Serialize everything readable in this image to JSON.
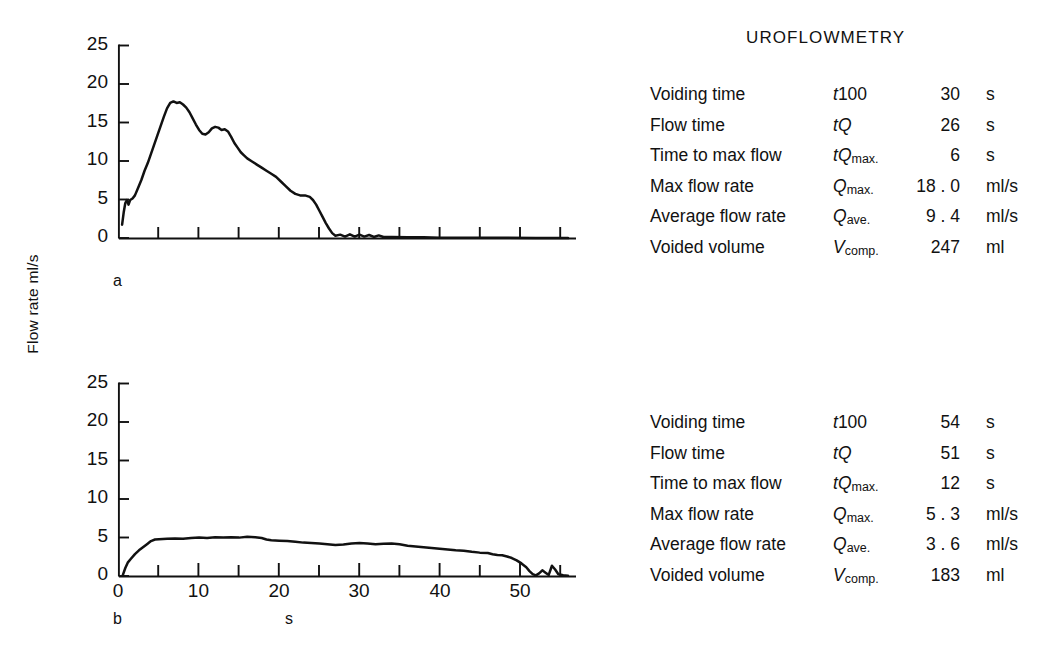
{
  "report": {
    "title": "UROFLOWMETRY",
    "columns": [
      "parameter",
      "symbol",
      "value",
      "unit"
    ],
    "panel_a": {
      "panel_letter": "a",
      "rows": [
        {
          "parameter": "Voiding time",
          "symbol_base": "t",
          "symbol_rest": "100",
          "symbol_sub": "",
          "value": "30",
          "unit": "s"
        },
        {
          "parameter": "Flow time",
          "symbol_base": "t",
          "symbol_rest": "Q",
          "symbol_sub": "",
          "value": "26",
          "unit": "s"
        },
        {
          "parameter": "Time to max flow",
          "symbol_base": "t",
          "symbol_rest": "Q",
          "symbol_sub": "max.",
          "value": "6",
          "unit": "s"
        },
        {
          "parameter": "Max flow rate",
          "symbol_base": "",
          "symbol_rest": "Q",
          "symbol_sub": "max.",
          "value": "18 . 0",
          "unit": "ml/s"
        },
        {
          "parameter": "Average flow rate",
          "symbol_base": "",
          "symbol_rest": "Q",
          "symbol_sub": "ave.",
          "value": "9 . 4",
          "unit": "ml/s"
        },
        {
          "parameter": "Voided volume",
          "symbol_base": "",
          "symbol_rest": "V",
          "symbol_sub": "comp.",
          "value": "247",
          "unit": "ml"
        }
      ]
    },
    "panel_b": {
      "panel_letter": "b",
      "rows": [
        {
          "parameter": "Voiding time",
          "symbol_base": "t",
          "symbol_rest": "100",
          "symbol_sub": "",
          "value": "54",
          "unit": "s"
        },
        {
          "parameter": "Flow time",
          "symbol_base": "t",
          "symbol_rest": "Q",
          "symbol_sub": "",
          "value": "51",
          "unit": "s"
        },
        {
          "parameter": "Time to max flow",
          "symbol_base": "t",
          "symbol_rest": "Q",
          "symbol_sub": "max.",
          "value": "12",
          "unit": "s"
        },
        {
          "parameter": "Max flow rate",
          "symbol_base": "",
          "symbol_rest": "Q",
          "symbol_sub": "max.",
          "value": "5 . 3",
          "unit": "ml/s"
        },
        {
          "parameter": "Average flow rate",
          "symbol_base": "",
          "symbol_rest": "Q",
          "symbol_sub": "ave.",
          "value": "3 . 6",
          "unit": "ml/s"
        },
        {
          "parameter": "Voided volume",
          "symbol_base": "",
          "symbol_rest": "V",
          "symbol_sub": "comp.",
          "value": "183",
          "unit": "ml"
        }
      ]
    }
  },
  "axes": {
    "ylabel": "Flow rate ml/s",
    "xcaption": "s",
    "ytick_labels": [
      "25",
      "20",
      "15",
      "10",
      "5",
      "0"
    ],
    "ytick_values": [
      25,
      20,
      15,
      10,
      5,
      0
    ],
    "xtick_labels_b": [
      "0",
      "10",
      "20",
      "30",
      "40",
      "50"
    ],
    "xtick_values_b": [
      0,
      10,
      20,
      30,
      40,
      50
    ],
    "xminor_step": 5
  },
  "chart_data": [
    {
      "type": "line",
      "id": "uroflow-a",
      "panel_letter": "a",
      "title": "UROFLOWMETRY",
      "xlabel": "",
      "ylabel": "Flow rate ml/s",
      "xlim": [
        0,
        57
      ],
      "ylim": [
        0,
        25
      ],
      "grid": false,
      "legend": "none",
      "xticks": [
        0,
        5,
        10,
        15,
        20,
        25,
        30,
        35,
        40,
        45,
        50,
        55
      ],
      "xtick_labels_shown": false,
      "yticks": [
        0,
        5,
        10,
        15,
        20,
        25
      ],
      "annotations": {
        "max_flow_rate": 18.0,
        "average_flow_rate": 9.4,
        "time_to_max_flow": 6,
        "flow_time": 26,
        "voiding_time": 30,
        "voided_volume": 247
      },
      "x": [
        0.4,
        0.6,
        0.8,
        1.0,
        1.2,
        1.4,
        1.7,
        2.0,
        2.4,
        2.8,
        3.2,
        3.6,
        4.0,
        4.4,
        4.8,
        5.2,
        5.6,
        6.0,
        6.4,
        6.8,
        7.2,
        7.6,
        8.0,
        8.4,
        8.8,
        9.2,
        9.6,
        10.0,
        10.4,
        10.8,
        11.2,
        11.6,
        12.0,
        12.4,
        12.8,
        13.2,
        13.6,
        14.0,
        14.4,
        14.8,
        15.2,
        15.6,
        16.0,
        16.6,
        17.2,
        17.8,
        18.4,
        19.0,
        19.6,
        20.2,
        20.8,
        21.4,
        22.0,
        22.6,
        23.2,
        23.8,
        24.2,
        24.6,
        25.0,
        25.4,
        25.8,
        26.2,
        26.6,
        27.0,
        27.6,
        28.2,
        28.8,
        29.4,
        30.0,
        30.6,
        31.2,
        31.8,
        32.4,
        33.0,
        34.0,
        36.0,
        38.0,
        40.0,
        44.0,
        48.0,
        52.0,
        56.0
      ],
      "y": [
        1.8,
        3.4,
        4.6,
        5.0,
        4.4,
        5.0,
        5.2,
        5.6,
        6.6,
        7.6,
        8.8,
        9.8,
        11.0,
        12.2,
        13.4,
        14.6,
        15.8,
        16.9,
        17.6,
        17.8,
        17.6,
        17.7,
        17.4,
        17.0,
        16.4,
        15.6,
        14.8,
        14.1,
        13.6,
        13.5,
        13.8,
        14.3,
        14.5,
        14.4,
        14.1,
        14.2,
        13.9,
        13.2,
        12.4,
        11.8,
        11.2,
        10.8,
        10.4,
        10.0,
        9.6,
        9.2,
        8.8,
        8.4,
        8.0,
        7.4,
        6.8,
        6.2,
        5.8,
        5.6,
        5.6,
        5.4,
        5.0,
        4.4,
        3.6,
        2.8,
        2.0,
        1.3,
        0.7,
        0.35,
        0.5,
        0.25,
        0.55,
        0.25,
        0.5,
        0.25,
        0.45,
        0.2,
        0.4,
        0.2,
        0.2,
        0.15,
        0.15,
        0.1,
        0.1,
        0.1,
        0.08,
        0.05
      ]
    },
    {
      "type": "line",
      "id": "uroflow-b",
      "panel_letter": "b",
      "title": "",
      "xlabel": "s",
      "ylabel": "Flow rate ml/s",
      "xlim": [
        0,
        57
      ],
      "ylim": [
        0,
        25
      ],
      "grid": false,
      "legend": "none",
      "xticks": [
        0,
        5,
        10,
        15,
        20,
        25,
        30,
        35,
        40,
        45,
        50,
        55
      ],
      "xtick_labels_shown": true,
      "yticks": [
        0,
        5,
        10,
        15,
        20,
        25
      ],
      "annotations": {
        "max_flow_rate": 5.3,
        "average_flow_rate": 3.6,
        "time_to_max_flow": 12,
        "flow_time": 51,
        "voiding_time": 54,
        "voided_volume": 183
      },
      "x": [
        0.5,
        0.8,
        1.1,
        1.5,
        2.0,
        2.5,
        3.0,
        3.5,
        4.0,
        4.5,
        5.0,
        6.0,
        7.0,
        8.0,
        9.0,
        10.0,
        11.0,
        12.0,
        13.0,
        14.0,
        15.0,
        16.0,
        17.0,
        17.8,
        18.4,
        19.0,
        20.0,
        21.0,
        22.0,
        23.0,
        24.0,
        25.0,
        26.0,
        27.0,
        28.0,
        29.0,
        30.0,
        31.0,
        32.0,
        33.0,
        34.0,
        35.0,
        36.0,
        37.0,
        38.0,
        39.0,
        40.0,
        41.0,
        42.0,
        43.0,
        44.0,
        45.0,
        46.0,
        46.6,
        47.2,
        47.8,
        48.4,
        49.0,
        49.6,
        50.2,
        50.8,
        51.2,
        51.6,
        52.0,
        52.4,
        52.8,
        53.2,
        53.6,
        54.0,
        54.4,
        54.8,
        55.4,
        56.0
      ],
      "y": [
        0.2,
        1.1,
        1.8,
        2.3,
        2.9,
        3.4,
        3.8,
        4.2,
        4.6,
        4.8,
        4.85,
        4.9,
        4.95,
        4.9,
        5.0,
        5.05,
        5.0,
        5.1,
        5.05,
        5.1,
        5.05,
        5.15,
        5.1,
        5.0,
        4.8,
        4.7,
        4.65,
        4.6,
        4.5,
        4.4,
        4.35,
        4.3,
        4.2,
        4.1,
        4.15,
        4.3,
        4.35,
        4.3,
        4.2,
        4.25,
        4.3,
        4.2,
        4.0,
        3.9,
        3.8,
        3.7,
        3.6,
        3.5,
        3.4,
        3.35,
        3.2,
        3.1,
        3.05,
        2.9,
        2.8,
        2.75,
        2.6,
        2.4,
        2.1,
        1.7,
        1.2,
        0.7,
        0.3,
        0.15,
        0.4,
        0.8,
        0.5,
        0.2,
        1.4,
        0.9,
        0.3,
        0.15,
        0.1
      ]
    }
  ]
}
